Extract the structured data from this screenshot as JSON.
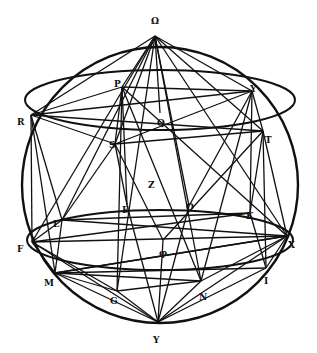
{
  "diagram": {
    "type": "geometric-construction",
    "stroke_color": "#111111",
    "background": "#ffffff",
    "sphere": {
      "cx": 160,
      "cy": 185,
      "r": 138
    },
    "ellipses": [
      {
        "name": "upper-circle",
        "cx": 160,
        "cy": 100,
        "rx": 135,
        "ry": 30
      },
      {
        "name": "lower-circle",
        "cx": 160,
        "cy": 240,
        "rx": 133,
        "ry": 30
      }
    ],
    "points": [
      {
        "id": "top",
        "label": "Ω",
        "x": 155,
        "y": 36,
        "lx": 151,
        "ly": 16
      },
      {
        "id": "P",
        "label": "P",
        "x": 122,
        "y": 87,
        "lx": 114,
        "ly": 79
      },
      {
        "id": "Y",
        "label": "Y",
        "x": 252,
        "y": 91,
        "lx": 250,
        "ly": 84
      },
      {
        "id": "R",
        "label": "R",
        "x": 31,
        "y": 115,
        "lx": 17,
        "ly": 117
      },
      {
        "id": "Q",
        "label": "Q",
        "x": 160,
        "y": 113,
        "lx": 157,
        "ly": 118
      },
      {
        "id": "S",
        "label": "S",
        "x": 115,
        "y": 144,
        "lx": 109,
        "ly": 140
      },
      {
        "id": "T",
        "label": "T",
        "x": 263,
        "y": 131,
        "lx": 265,
        "ly": 135
      },
      {
        "id": "Z",
        "label": "Z",
        "x": 150,
        "y": 178,
        "lx": 148,
        "ly": 180
      },
      {
        "id": "E",
        "label": "E",
        "x": 127,
        "y": 205,
        "lx": 122,
        "ly": 205
      },
      {
        "id": "O",
        "label": "O",
        "x": 189,
        "y": 206,
        "lx": 186,
        "ly": 202
      },
      {
        "id": "K",
        "label": "K",
        "x": 250,
        "y": 213,
        "lx": 246,
        "ly": 211
      },
      {
        "id": "L",
        "label": "L",
        "x": 62,
        "y": 220,
        "lx": 53,
        "ly": 219
      },
      {
        "id": "F",
        "label": "F",
        "x": 32,
        "y": 242,
        "lx": 17,
        "ly": 244
      },
      {
        "id": "X",
        "label": "X",
        "x": 287,
        "y": 236,
        "lx": 288,
        "ly": 240
      },
      {
        "id": "phi",
        "label": "φ",
        "x": 163,
        "y": 240,
        "lx": 159,
        "ly": 248
      },
      {
        "id": "M",
        "label": "M",
        "x": 55,
        "y": 273,
        "lx": 44,
        "ly": 278
      },
      {
        "id": "I",
        "label": "I",
        "x": 266,
        "y": 268,
        "lx": 264,
        "ly": 276
      },
      {
        "id": "G",
        "label": "G",
        "x": 117,
        "y": 291,
        "lx": 110,
        "ly": 296
      },
      {
        "id": "N",
        "label": "N",
        "x": 201,
        "y": 281,
        "lx": 199,
        "ly": 292
      },
      {
        "id": "bottom",
        "label": "Υ",
        "x": 158,
        "y": 322,
        "lx": 153,
        "ly": 335
      }
    ],
    "edges": [
      [
        "top",
        "P"
      ],
      [
        "top",
        "Y"
      ],
      [
        "top",
        "R"
      ],
      [
        "top",
        "T"
      ],
      [
        "top",
        "S"
      ],
      [
        "top",
        "Q"
      ],
      [
        "top",
        "F"
      ],
      [
        "top",
        "L"
      ],
      [
        "top",
        "O"
      ],
      [
        "top",
        "X"
      ],
      [
        "top",
        "N"
      ],
      [
        "top",
        "G"
      ],
      [
        "R",
        "P"
      ],
      [
        "R",
        "Y"
      ],
      [
        "R",
        "S"
      ],
      [
        "R",
        "T"
      ],
      [
        "R",
        "F"
      ],
      [
        "R",
        "L"
      ],
      [
        "R",
        "M"
      ],
      [
        "P",
        "Y"
      ],
      [
        "P",
        "S"
      ],
      [
        "P",
        "E"
      ],
      [
        "P",
        "G"
      ],
      [
        "P",
        "N"
      ],
      [
        "P",
        "X"
      ],
      [
        "Y",
        "T"
      ],
      [
        "Y",
        "S"
      ],
      [
        "Y",
        "O"
      ],
      [
        "Y",
        "K"
      ],
      [
        "Y",
        "N"
      ],
      [
        "S",
        "T"
      ],
      [
        "S",
        "E"
      ],
      [
        "S",
        "phi"
      ],
      [
        "S",
        "L"
      ],
      [
        "T",
        "K"
      ],
      [
        "T",
        "X"
      ],
      [
        "T",
        "I"
      ],
      [
        "T",
        "phi"
      ],
      [
        "L",
        "F"
      ],
      [
        "L",
        "M"
      ],
      [
        "L",
        "X"
      ],
      [
        "L",
        "K"
      ],
      [
        "F",
        "M"
      ],
      [
        "F",
        "X"
      ],
      [
        "F",
        "K"
      ],
      [
        "F",
        "G"
      ],
      [
        "M",
        "X"
      ],
      [
        "M",
        "G"
      ],
      [
        "M",
        "N"
      ],
      [
        "M",
        "I"
      ],
      [
        "X",
        "I"
      ],
      [
        "X",
        "N"
      ],
      [
        "X",
        "M"
      ],
      [
        "G",
        "bottom"
      ],
      [
        "N",
        "bottom"
      ],
      [
        "M",
        "bottom"
      ],
      [
        "I",
        "bottom"
      ],
      [
        "phi",
        "bottom"
      ],
      [
        "E",
        "bottom"
      ],
      [
        "O",
        "bottom"
      ],
      [
        "K",
        "I"
      ],
      [
        "G",
        "N"
      ],
      [
        "F",
        "bottom"
      ],
      [
        "X",
        "bottom"
      ]
    ]
  }
}
